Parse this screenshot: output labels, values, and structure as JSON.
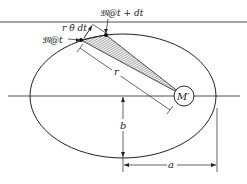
{
  "diagram": {
    "labels": {
      "point_t": "𝔐@t",
      "point_t_dt": "𝔐@t + dt",
      "arc_length": "r θ̇ dt",
      "radius": "r",
      "focus_mass": "M′",
      "semi_minor": "b",
      "semi_major": "a"
    },
    "colors": {
      "stroke": "#222222",
      "top_rule": "#888888",
      "background": "#ffffff"
    }
  }
}
